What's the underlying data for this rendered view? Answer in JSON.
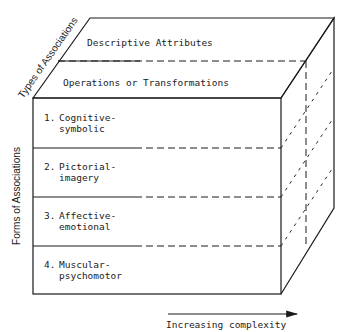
{
  "diagram": {
    "type": "3d-cube-taxonomy",
    "top_axis_label": "Types of Associations",
    "left_axis_label": "Forms of Associations",
    "bottom_axis_label": "Increasing complexity",
    "types": [
      {
        "label": "Descriptive Attributes"
      },
      {
        "label": "Operations or Transformations"
      }
    ],
    "forms": [
      {
        "number": "1.",
        "line1": "Cognitive-",
        "line2": "symbolic"
      },
      {
        "number": "2.",
        "line1": "Pictorial-",
        "line2": "imagery"
      },
      {
        "number": "3.",
        "line1": "Affective-",
        "line2": "emotional"
      },
      {
        "number": "4.",
        "line1": "Muscular-",
        "line2": "psychomotor"
      }
    ],
    "colors": {
      "line": "#1a1a1a",
      "background": "#ffffff"
    }
  }
}
